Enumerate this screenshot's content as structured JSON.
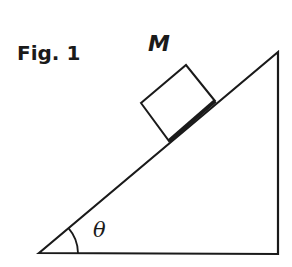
{
  "figure": {
    "title": "Fig. 1",
    "mass_label": "M",
    "angle_label": "θ",
    "colors": {
      "stroke": "#1a1a1a",
      "background": "#ffffff"
    }
  }
}
